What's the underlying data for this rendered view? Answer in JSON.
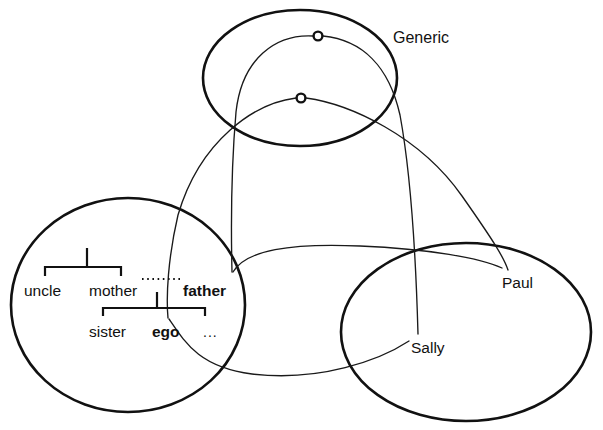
{
  "diagram": {
    "type": "conceptual-graph-diagram",
    "regions": [
      {
        "id": "generic",
        "label": "Generic",
        "label_x": 393,
        "label_y": 30,
        "cx": 300,
        "cy": 78,
        "rx": 97,
        "ry": 68,
        "nodes": [
          {
            "id": "generic-node-upper",
            "cx": 318,
            "cy": 36,
            "r": 4.4
          },
          {
            "id": "generic-node-lower",
            "cx": 301,
            "cy": 98,
            "r": 4.4
          }
        ]
      },
      {
        "id": "kinship",
        "label": "",
        "cx": 128,
        "cy": 305,
        "rx": 117,
        "ry": 107
      },
      {
        "id": "instance",
        "label": "",
        "cx": 466,
        "cy": 332,
        "rx": 125,
        "ry": 89
      }
    ],
    "kinship_terms": [
      {
        "id": "uncle",
        "text": "uncle",
        "x": 24,
        "y": 283,
        "style": "plain"
      },
      {
        "id": "mother",
        "text": "mother",
        "x": 89,
        "y": 283,
        "style": "plain"
      },
      {
        "id": "father",
        "text": "father",
        "x": 183,
        "y": 283,
        "style": "bold"
      },
      {
        "id": "sister",
        "text": "sister",
        "x": 89,
        "y": 324,
        "style": "plain"
      },
      {
        "id": "ego",
        "text": "ego",
        "x": 152,
        "y": 324,
        "style": "bold"
      },
      {
        "id": "etc",
        "text": "...",
        "x": 203,
        "y": 325,
        "style": "ellipsis"
      }
    ],
    "instance_terms": [
      {
        "id": "paul",
        "text": "Paul",
        "x": 502,
        "y": 275,
        "style": "plain"
      },
      {
        "id": "sally",
        "text": "Sally",
        "x": 411,
        "y": 340,
        "style": "plain"
      }
    ],
    "brackets": [
      {
        "id": "parent-bracket",
        "bar_y": 267,
        "x_left": 45,
        "x_right": 121,
        "tick_depth": 9,
        "stem_x": 87,
        "stem_top": 248
      },
      {
        "id": "sibling-bracket",
        "bar_y": 308,
        "x_left": 103,
        "x_right": 205,
        "tick_depth": 8,
        "stem_x": 157,
        "stem_top": 292
      }
    ],
    "dotted_link": {
      "id": "mother-father-link",
      "x1": 142,
      "y1": 279,
      "x2": 181,
      "y2": 279
    },
    "connectors": [
      {
        "id": "generic-lower-to-ego",
        "from": "generic-node-lower",
        "to": "ego",
        "path": "M 296 98 C 255 103 200 140 178 215 C 168 258 166 296 168 318"
      },
      {
        "id": "generic-upper-to-father",
        "from": "generic-node-upper",
        "to": "father",
        "path": "M 313 36 C 276 34 242 58 236 112 C 231 170 231 230 232 272"
      },
      {
        "id": "generic-upper-to-sally",
        "from": "generic-node-upper",
        "to": "sally",
        "path": "M 323 36 C 362 40 389 66 400 115 C 411 175 416 262 418 334"
      },
      {
        "id": "generic-lower-to-paul",
        "from": "generic-node-lower",
        "to": "paul",
        "path": "M 306 98 C 350 104 420 136 462 196 C 495 243 504 258 508 270"
      },
      {
        "id": "father-to-paul-arc",
        "from": "father",
        "to": "paul",
        "path": "M 233 272 C 246 250 290 243 360 246 C 430 249 480 258 502 268"
      },
      {
        "id": "ego-to-sally-arc",
        "from": "ego",
        "to": "sally",
        "path": "M 169 319 C 186 344 200 367 252 374 C 320 382 380 360 409 341"
      }
    ]
  }
}
